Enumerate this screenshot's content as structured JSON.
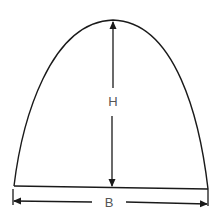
{
  "diagram": {
    "labels": {
      "height": "H",
      "base": "B"
    },
    "colors": {
      "stroke": "#1a1a1a",
      "label": "#555555",
      "background": "#ffffff"
    }
  }
}
